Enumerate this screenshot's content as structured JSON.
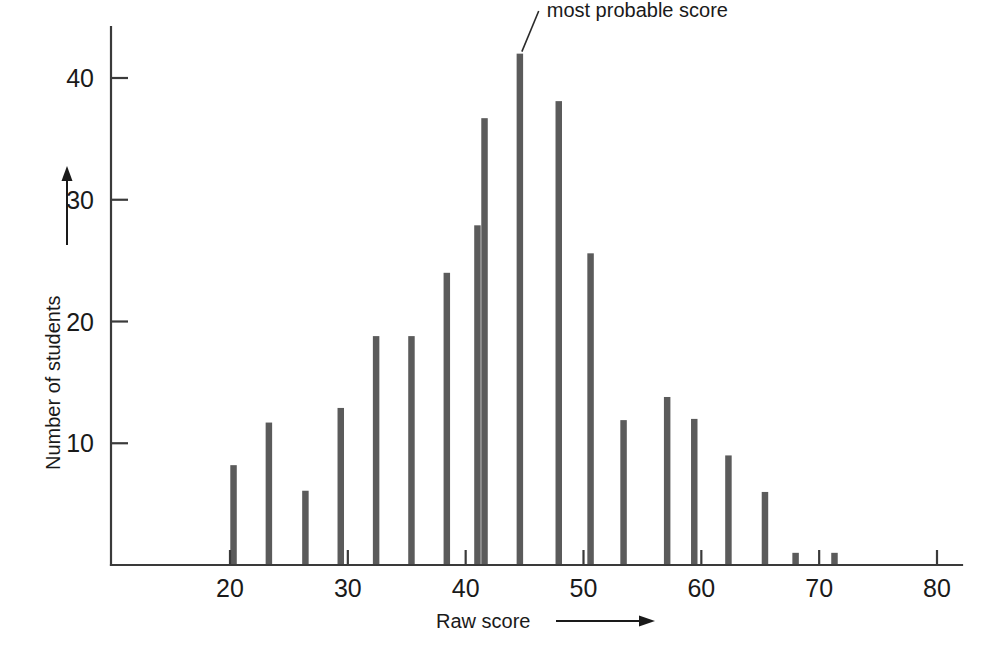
{
  "chart_data": {
    "type": "bar",
    "title": "",
    "xlabel": "Raw score",
    "ylabel": "Number of students",
    "xlim": [
      12,
      82
    ],
    "ylim": [
      0,
      44
    ],
    "grid": false,
    "legend": null,
    "xticks": [
      20,
      30,
      40,
      50,
      60,
      70,
      80
    ],
    "xtick_labels": [
      "20",
      "30",
      "40",
      "50",
      "60",
      "70",
      "80"
    ],
    "yticks": [
      10,
      20,
      30,
      40
    ],
    "ytick_labels": [
      "10",
      "20",
      "30",
      "40"
    ],
    "bar_width_units": 0.55,
    "x": [
      20.3,
      23.3,
      26.4,
      29.4,
      32.4,
      35.4,
      38.4,
      41.0,
      41.6,
      44.6,
      47.9,
      50.6,
      53.4,
      57.1,
      59.4,
      62.3,
      65.4,
      68.0,
      71.3
    ],
    "values": [
      8.2,
      11.7,
      6.1,
      12.9,
      18.8,
      18.8,
      24.0,
      27.9,
      36.7,
      42.0,
      38.1,
      25.6,
      11.9,
      13.8,
      12.0,
      9.0,
      6.0,
      1.0,
      1.0
    ],
    "annotations": [
      {
        "text": "most probable score",
        "points_to_x": 44.6,
        "points_to_y": 42.0,
        "label_x": 46.2,
        "label_y": 45.5
      }
    ]
  },
  "axes": {
    "x_axis_arrow": true,
    "y_axis_arrow": true,
    "x_label_text": "Raw score",
    "y_label_text": "Number of students"
  }
}
